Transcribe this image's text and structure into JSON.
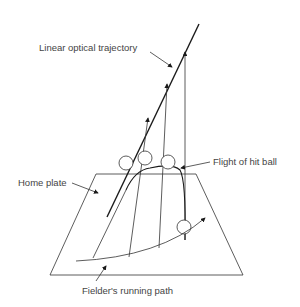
{
  "diagram": {
    "labels": {
      "trajectory": "Linear optical trajectory",
      "flight": "Flight of hit ball",
      "home_plate": "Home plate",
      "running_path": "Fielder's running path"
    },
    "colors": {
      "stroke": "#1a1a1a",
      "text": "#444444",
      "background": "#ffffff"
    }
  }
}
